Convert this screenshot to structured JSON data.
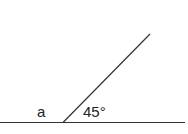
{
  "diagram": {
    "type": "angle-diagram",
    "labels": {
      "unknown_angle": "a",
      "given_angle": "45°"
    },
    "lines": {
      "baseline": {
        "x1": 0,
        "y1": 122,
        "x2": 185,
        "y2": 122
      },
      "ray": {
        "x1": 63,
        "y1": 122,
        "x2": 150,
        "y2": 34
      }
    },
    "stroke_color": "#333333"
  }
}
